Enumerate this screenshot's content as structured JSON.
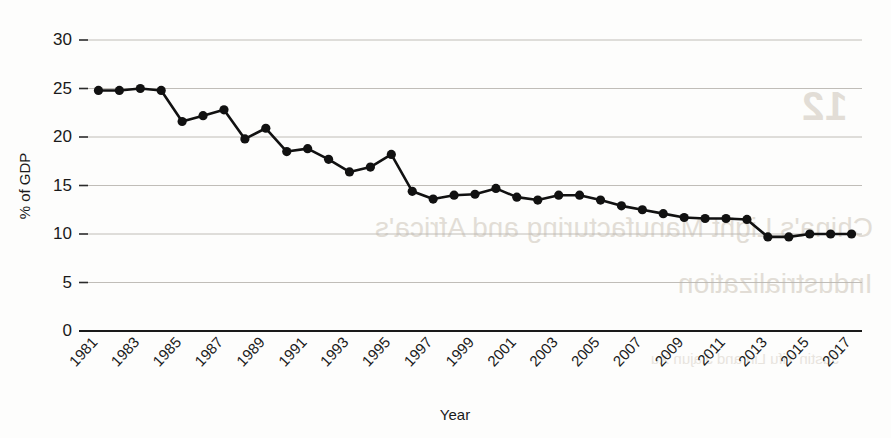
{
  "chart_data": {
    "type": "line",
    "title": "",
    "xlabel": "Year",
    "ylabel": "% of GDP",
    "xlim": [
      1980.5,
      2017.5
    ],
    "ylim": [
      0,
      30
    ],
    "grid": true,
    "legend": "none",
    "marker": "filled-circle",
    "line_color": "#111111",
    "grid_color": "#b9b6b0",
    "y_ticks": [
      0,
      5,
      10,
      15,
      20,
      25,
      30
    ],
    "y_tick_labels": [
      "0",
      "5",
      "10",
      "15",
      "20",
      "25",
      "30"
    ],
    "x_tick_labels": [
      "1981",
      "1983",
      "1985",
      "1987",
      "1989",
      "1991",
      "1993",
      "1995",
      "1997",
      "1999",
      "2001",
      "2003",
      "2005",
      "2007",
      "2009",
      "2011",
      "2013",
      "2015",
      "2017"
    ],
    "x": [
      1981,
      1982,
      1983,
      1984,
      1985,
      1986,
      1987,
      1988,
      1989,
      1990,
      1991,
      1992,
      1993,
      1994,
      1995,
      1996,
      1997,
      1998,
      1999,
      2000,
      2001,
      2002,
      2003,
      2004,
      2005,
      2006,
      2007,
      2008,
      2009,
      2010,
      2011,
      2012,
      2013,
      2014,
      2015,
      2016,
      2017
    ],
    "values": [
      24.8,
      24.8,
      25.0,
      24.8,
      21.6,
      22.2,
      22.8,
      19.8,
      20.9,
      18.5,
      18.8,
      17.7,
      16.4,
      16.9,
      18.2,
      14.4,
      13.6,
      14.0,
      14.1,
      14.7,
      13.8,
      13.5,
      14.0,
      14.0,
      13.5,
      12.9,
      12.5,
      12.1,
      11.7,
      11.6,
      11.6,
      11.5,
      9.7,
      9.7,
      10.0,
      10.0,
      10.0
    ]
  },
  "watermark": {
    "number": "12",
    "line1": "China's Light Manufacturing and Africa's",
    "line2": "Industrialization",
    "line3": "Justin Yifu Lin and Jiajun Xu",
    "top": ""
  }
}
